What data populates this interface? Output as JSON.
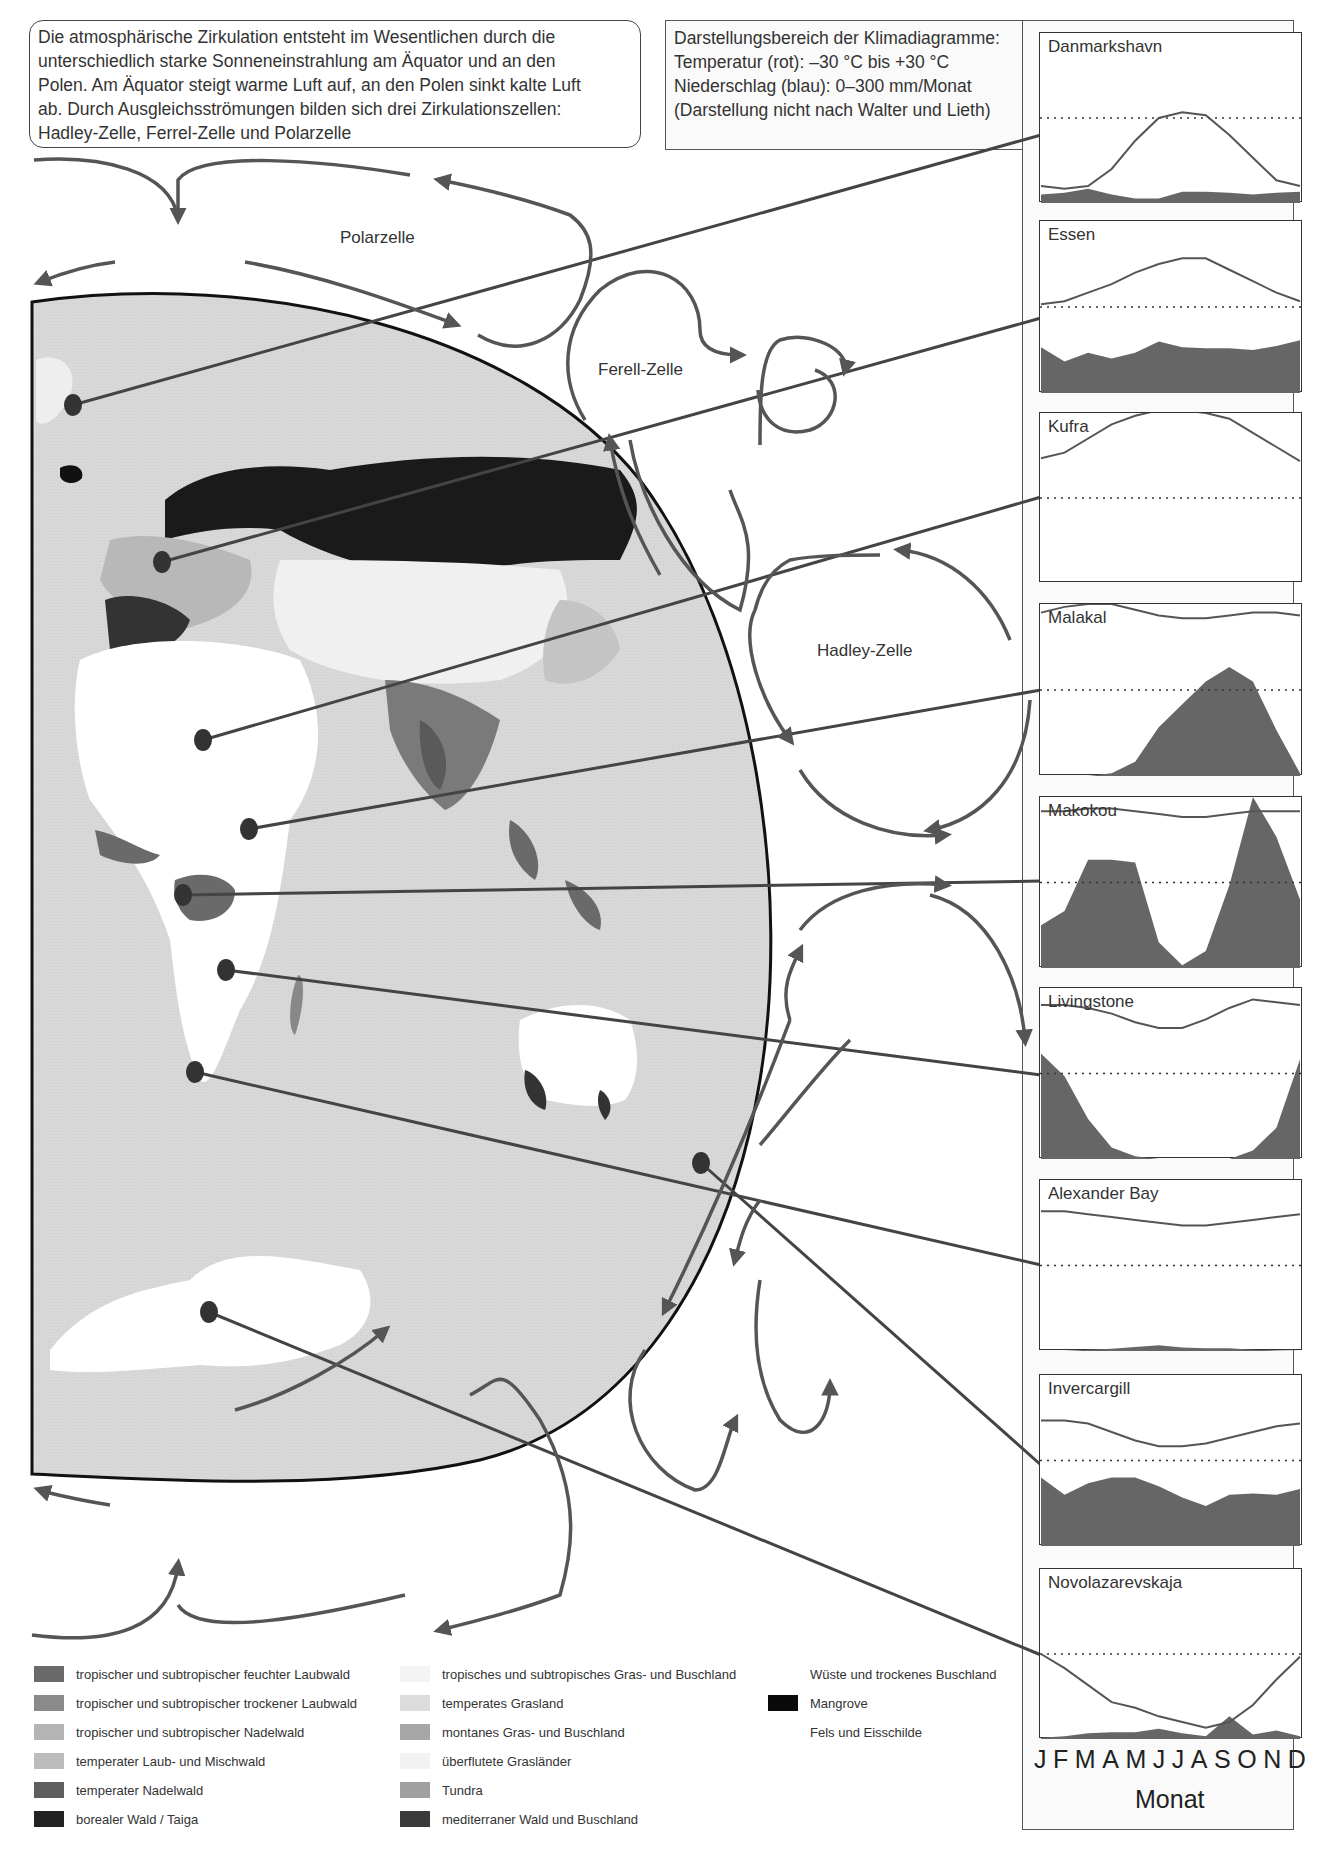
{
  "intro": {
    "lines": [
      "Die atmosphärische Zirkulation entsteht im Wesentlichen durch die",
      "unterschiedlich starke Sonneneinstrahlung am Äquator und an den",
      "Polen. Am Äquator steigt warme Luft auf, an den Polen sinkt kalte Luft",
      "ab. Durch Ausgleichsströmungen bilden sich drei Zirkulationszellen:",
      "Hadley-Zelle, Ferrel-Zelle und Polarzelle"
    ]
  },
  "scale_info": {
    "lines": [
      "Darstellungsbereich der Klimadiagramme:",
      "Temperatur (rot): –30 °C bis +30 °C",
      "Niederschlag (blau): 0–300 mm/Monat",
      "(Darstellung nicht nach Walter und Lieth)"
    ]
  },
  "cells": {
    "polar": "Polarzelle",
    "ferrel": "Ferell-Zelle",
    "hadley": "Hadley-Zelle"
  },
  "months": [
    "J",
    "F",
    "M",
    "A",
    "M",
    "J",
    "J",
    "A",
    "S",
    "O",
    "N",
    "D"
  ],
  "month_axis_label": "Monat",
  "colors": {
    "temperature_line": "#555555",
    "precipitation_fill": "#666666",
    "map_ocean": "#d9d9d9",
    "arrow": "#555555",
    "leader_line": "#444444"
  },
  "chart_data": {
    "type": "line+area",
    "title": "Klimadiagramme",
    "xlabel": "Monat",
    "categories": [
      "J",
      "F",
      "M",
      "A",
      "M",
      "J",
      "J",
      "A",
      "S",
      "O",
      "N",
      "D"
    ],
    "temperature_range_c": [
      -30,
      30
    ],
    "precipitation_range_mm": [
      0,
      300
    ],
    "stations": [
      {
        "name": "Danmarkshavn",
        "top": 32,
        "height": 170,
        "temperature": [
          -24,
          -25,
          -24,
          -18,
          -8,
          0,
          2,
          1,
          -6,
          -14,
          -22,
          -24
        ],
        "precipitation": [
          15,
          18,
          25,
          15,
          8,
          8,
          20,
          20,
          18,
          15,
          18,
          20
        ]
      },
      {
        "name": "Essen",
        "top": 220,
        "height": 172,
        "temperature": [
          1,
          2,
          5,
          8,
          12,
          15,
          17,
          17,
          13,
          9,
          5,
          2
        ],
        "precipitation": [
          80,
          55,
          70,
          60,
          70,
          90,
          80,
          78,
          78,
          75,
          82,
          92
        ]
      },
      {
        "name": "Kufra",
        "top": 412,
        "height": 170,
        "temperature": [
          14,
          16,
          21,
          26,
          29,
          31,
          31,
          30,
          28,
          23,
          18,
          13
        ],
        "precipitation": [
          0,
          0,
          0,
          0,
          0,
          0,
          0,
          0,
          0,
          0,
          0,
          0
        ]
      },
      {
        "name": "Malakal",
        "top": 603,
        "height": 172,
        "temperature": [
          27,
          29,
          30,
          30,
          28,
          26,
          25,
          25,
          26,
          27,
          27,
          26
        ],
        "precipitation": [
          0,
          0,
          0,
          5,
          25,
          85,
          125,
          165,
          190,
          165,
          80,
          5
        ]
      },
      {
        "name": "Makokou",
        "top": 796,
        "height": 171,
        "temperature": [
          25,
          25,
          26,
          26,
          25,
          24,
          23,
          23,
          24,
          25,
          25,
          25
        ],
        "precipitation": [
          75,
          100,
          190,
          190,
          185,
          45,
          5,
          30,
          145,
          305,
          230,
          120
        ]
      },
      {
        "name": "Livingstone",
        "top": 987,
        "height": 171,
        "temperature": [
          24,
          24,
          23,
          21,
          18,
          16,
          16,
          19,
          23,
          26,
          25,
          24
        ],
        "precipitation": [
          185,
          145,
          70,
          20,
          5,
          0,
          0,
          0,
          0,
          15,
          55,
          175
        ]
      },
      {
        "name": "Alexander Bay",
        "top": 1179,
        "height": 171,
        "temperature": [
          19,
          19,
          18,
          17,
          16,
          15,
          14,
          14,
          15,
          16,
          17,
          18
        ],
        "precipitation": [
          0,
          0,
          2,
          4,
          7,
          10,
          6,
          5,
          5,
          2,
          1,
          0
        ]
      },
      {
        "name": "Invercargill",
        "top": 1374,
        "height": 171,
        "temperature": [
          14,
          14,
          13,
          10,
          7,
          5,
          5,
          6,
          8,
          10,
          12,
          13
        ],
        "precipitation": [
          120,
          90,
          110,
          120,
          120,
          105,
          85,
          70,
          90,
          92,
          90,
          100
        ]
      },
      {
        "name": "Novolazarevskaja",
        "top": 1568,
        "height": 170,
        "temperature": [
          0,
          -5,
          -11,
          -17,
          -19,
          -22,
          -24,
          -26,
          -24,
          -18,
          -9,
          -1
        ],
        "precipitation": [
          2,
          5,
          10,
          12,
          12,
          18,
          10,
          5,
          40,
          8,
          15,
          5
        ]
      }
    ]
  },
  "map_markers": [
    {
      "station": "Danmarkshavn",
      "x": 73,
      "y": 405
    },
    {
      "station": "Essen",
      "x": 162,
      "y": 562
    },
    {
      "station": "Kufra",
      "x": 203,
      "y": 740
    },
    {
      "station": "Malakal",
      "x": 249,
      "y": 829
    },
    {
      "station": "Makokou",
      "x": 183,
      "y": 895
    },
    {
      "station": "Livingstone",
      "x": 226,
      "y": 970
    },
    {
      "station": "Alexander Bay",
      "x": 195,
      "y": 1072
    },
    {
      "station": "Invercargill",
      "x": 701,
      "y": 1163
    },
    {
      "station": "Novolazarevskaja",
      "x": 209,
      "y": 1312
    }
  ],
  "legend": [
    {
      "label": "tropischer und subtropischer feuchter Laubwald",
      "color": "#6a6a6a"
    },
    {
      "label": "tropischer und subtropischer trockener Laubwald",
      "color": "#8a8a8a"
    },
    {
      "label": "tropischer und subtropischer Nadelwald",
      "color": "#b4b4b4"
    },
    {
      "label": "temperater Laub- und Mischwald",
      "color": "#bcbcbc"
    },
    {
      "label": "temperater Nadelwald",
      "color": "#5e5e5e"
    },
    {
      "label": "borealer Wald / Taiga",
      "color": "#222222"
    },
    {
      "label": "tropisches und subtropisches Gras- und Buschland",
      "color": "#f4f4f4"
    },
    {
      "label": "temperates Grasland",
      "color": "#dcdcdc"
    },
    {
      "label": "montanes Gras- und Buschland",
      "color": "#a6a6a6"
    },
    {
      "label": "überflutete Grasländer",
      "color": "#f2f2f2"
    },
    {
      "label": "Tundra",
      "color": "#a0a0a0"
    },
    {
      "label": "mediterraner Wald und Buschland",
      "color": "#3a3a3a"
    },
    {
      "label": "Wüste und trockenes Buschland",
      "color": "#ffffff"
    },
    {
      "label": "Mangrove",
      "color": "#0a0a0a"
    },
    {
      "label": "Fels und Eisschilde",
      "color": "#ffffff"
    }
  ]
}
